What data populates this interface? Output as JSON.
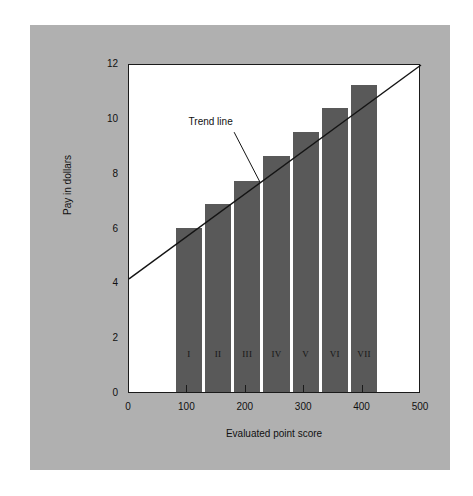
{
  "chart_data": {
    "type": "bar",
    "title": "",
    "xlabel": "Evaluated point score",
    "ylabel": "Pay in dollars",
    "categories": [
      "I",
      "II",
      "III",
      "IV",
      "V",
      "VI",
      "VII"
    ],
    "values": [
      6.0,
      6.85,
      7.7,
      8.6,
      9.5,
      10.35,
      11.2
    ],
    "bar_x_ranges": [
      [
        80,
        125
      ],
      [
        130,
        175
      ],
      [
        180,
        225
      ],
      [
        230,
        275
      ],
      [
        280,
        325
      ],
      [
        330,
        375
      ],
      [
        380,
        425
      ]
    ],
    "xlim": [
      0,
      500
    ],
    "ylim": [
      0,
      12
    ],
    "x_ticks": [
      0,
      100,
      200,
      300,
      400,
      500
    ],
    "x_tick_labels": [
      "0",
      "100",
      "200",
      "300",
      "400",
      "500"
    ],
    "y_ticks": [
      0,
      2,
      4,
      6,
      8,
      10,
      12
    ],
    "y_tick_labels": [
      "0",
      "2",
      "4",
      "6",
      "8",
      "10",
      "12"
    ],
    "grid": false,
    "legend": null,
    "series": [
      {
        "name": "Pay by evaluated point score",
        "values": [
          6.0,
          6.85,
          7.7,
          8.6,
          9.5,
          10.35,
          11.2
        ]
      },
      {
        "name": "Trend line",
        "type": "line",
        "points": [
          [
            0,
            4.2
          ],
          [
            500,
            12.0
          ]
        ]
      }
    ],
    "annotations": [
      {
        "text": "Trend line",
        "text_x": 150,
        "text_y": 9.9,
        "leader_from_x": 180,
        "leader_from_y": 9.55,
        "leader_to_x": 225,
        "leader_to_y": 7.7
      }
    ],
    "colors": {
      "bar_fill": "#595959",
      "trend_line": "#141414",
      "plot_background": "#ffffff",
      "panel_background": "#b0b0b0",
      "axis": "#1a1a1a",
      "text": "#111111"
    }
  }
}
